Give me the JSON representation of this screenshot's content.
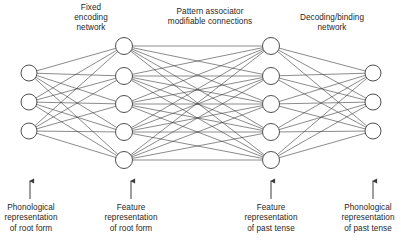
{
  "figure": {
    "kind": "neural-network-architecture-diagram",
    "background_color": "#ffffff",
    "line_color": "#3c3c3c",
    "node_fill": "#ffffff",
    "node_stroke": "#3c3c3c",
    "text_color": "#1f1f1f"
  },
  "section_titles": [
    {
      "id": "fixed-encoding",
      "text": "Fixed\nencoding\nnetwork",
      "x": 58,
      "y": 3,
      "width": 66
    },
    {
      "id": "pattern-associator",
      "text": "Pattern associator\nmodifiable connections",
      "x": 147,
      "y": 7,
      "width": 126
    },
    {
      "id": "decoding-binding",
      "text": "Decoding/binding\nnetwork",
      "x": 283,
      "y": 13,
      "width": 98
    }
  ],
  "io_labels": [
    {
      "id": "phonological-root",
      "text": "Phonological\nrepresentation\nof root form",
      "x": 0,
      "y": 203,
      "width": 62,
      "arrow_x": 30,
      "arrow_top": 176,
      "arrow_bottom": 199
    },
    {
      "id": "feature-root",
      "text": "Feature\nrepresentation\nof root form",
      "x": 93,
      "y": 203,
      "width": 76,
      "arrow_x": 131,
      "arrow_top": 176,
      "arrow_bottom": 199
    },
    {
      "id": "feature-past",
      "text": "Feature\nrepresentation\nof past tense",
      "x": 233,
      "y": 203,
      "width": 76,
      "arrow_x": 271,
      "arrow_top": 176,
      "arrow_bottom": 199
    },
    {
      "id": "phonological-past",
      "text": "Phonological\nrepresentation\nof past tense",
      "x": 335,
      "y": 203,
      "width": 66,
      "arrow_x": 373,
      "arrow_top": 176,
      "arrow_bottom": 199
    }
  ],
  "layers": [
    {
      "id": "input-phonological-root",
      "name": "Phonological representation of root form",
      "x": 29,
      "node_count": 3,
      "node_y": [
        73,
        102,
        131
      ],
      "radius": 8
    },
    {
      "id": "hidden-feature-root",
      "name": "Feature representation of root form",
      "x": 124,
      "node_count": 5,
      "node_y": [
        46,
        76,
        104,
        132,
        160
      ],
      "radius": 8.5
    },
    {
      "id": "hidden-feature-past",
      "name": "Feature representation of past tense",
      "x": 271,
      "node_count": 5,
      "node_y": [
        46,
        76,
        104,
        132,
        160
      ],
      "radius": 8.5
    },
    {
      "id": "output-phonological-past",
      "name": "Phonological representation of past tense",
      "x": 373,
      "node_count": 3,
      "node_y": [
        73,
        102,
        131
      ],
      "radius": 8
    }
  ],
  "connections": [
    {
      "id": "encode",
      "from_layer": "input-phonological-root",
      "to_layer": "hidden-feature-root",
      "pattern": "fully-connected",
      "count": 15
    },
    {
      "id": "associate",
      "from_layer": "hidden-feature-root",
      "to_layer": "hidden-feature-past",
      "pattern": "fully-connected",
      "count": 25
    },
    {
      "id": "decode",
      "from_layer": "hidden-feature-past",
      "to_layer": "output-phonological-past",
      "pattern": "fully-connected",
      "count": 15
    }
  ]
}
